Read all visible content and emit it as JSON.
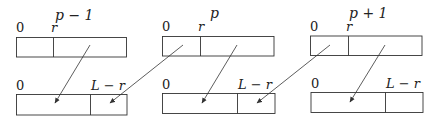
{
  "diagram": {
    "type": "block-shift-mapping",
    "blocks": [
      {
        "id": "p-minus-1",
        "title": "p − 1",
        "top_row": {
          "start_label": "0",
          "split_label": "r"
        },
        "bottom_row": {
          "start_label": "0",
          "split_label": "L − r"
        }
      },
      {
        "id": "p",
        "title": "p",
        "top_row": {
          "start_label": "0",
          "split_label": "r"
        },
        "bottom_row": {
          "start_label": "0",
          "split_label": "L − r"
        }
      },
      {
        "id": "p-plus-1",
        "title": "p + 1",
        "top_row": {
          "start_label": "0",
          "split_label": "r"
        },
        "bottom_row": {
          "start_label": "0",
          "split_label": "L − r"
        }
      }
    ],
    "arrows": [
      {
        "from": "p-1 top [r, L)",
        "to": "p-1 bottom [0, L−r)"
      },
      {
        "from": "p top [0, r)",
        "to": "p-1 bottom [L−r, L)"
      },
      {
        "from": "p top [r, L)",
        "to": "p bottom [0, L−r)"
      },
      {
        "from": "p+1 top [0, r)",
        "to": "p bottom [L−r, L)"
      },
      {
        "from": "p+1 top [r, L)",
        "to": "p+1 bottom [0, L−r)"
      }
    ],
    "colors": {
      "line": "#333333",
      "text": "#222222",
      "background": "#ffffff"
    }
  }
}
